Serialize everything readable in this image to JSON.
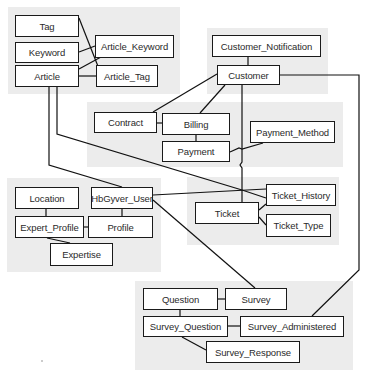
{
  "diagram": {
    "type": "entity-relationship",
    "groups": [
      {
        "id": "content",
        "entities": [
          "Tag",
          "Keyword",
          "Article",
          "Article_Keyword",
          "Article_Tag"
        ]
      },
      {
        "id": "customer",
        "entities": [
          "Customer_Notification",
          "Customer"
        ]
      },
      {
        "id": "billing",
        "entities": [
          "Contract",
          "Billing",
          "Payment",
          "Payment_Method"
        ]
      },
      {
        "id": "user",
        "entities": [
          "Location",
          "HbGyver_User",
          "Expert_Profile",
          "Profile",
          "Expertise"
        ]
      },
      {
        "id": "ticket",
        "entities": [
          "Ticket",
          "Ticket_History",
          "Ticket_Type"
        ]
      },
      {
        "id": "survey",
        "entities": [
          "Question",
          "Survey",
          "Survey_Question",
          "Survey_Administered",
          "Survey_Response"
        ]
      }
    ],
    "entities": {
      "tag": "Tag",
      "keyword": "Keyword",
      "article": "Article",
      "article_keyword": "Article_Keyword",
      "article_tag": "Article_Tag",
      "customer_notification": "Customer_Notification",
      "customer": "Customer",
      "contract": "Contract",
      "billing": "Billing",
      "payment": "Payment",
      "payment_method": "Payment_Method",
      "location": "Location",
      "hbgyver_user": "HbGyver_User",
      "expert_profile": "Expert_Profile",
      "profile": "Profile",
      "expertise": "Expertise",
      "ticket": "Ticket",
      "ticket_history": "Ticket_History",
      "ticket_type": "Ticket_Type",
      "question": "Question",
      "survey": "Survey",
      "survey_question": "Survey_Question",
      "survey_administered": "Survey_Administered",
      "survey_response": "Survey_Response"
    },
    "relationships": [
      [
        "Tag",
        "Article_Tag"
      ],
      [
        "Keyword",
        "Article_Keyword"
      ],
      [
        "Article",
        "Article_Keyword"
      ],
      [
        "Article",
        "Article_Tag"
      ],
      [
        "Article",
        "HbGyver_User"
      ],
      [
        "Article",
        "Ticket_History"
      ],
      [
        "Customer_Notification",
        "Customer"
      ],
      [
        "Customer",
        "Contract"
      ],
      [
        "Customer",
        "Billing"
      ],
      [
        "Customer",
        "Ticket"
      ],
      [
        "Customer",
        "Survey_Administered"
      ],
      [
        "Contract",
        "Billing"
      ],
      [
        "Billing",
        "Payment"
      ],
      [
        "Payment",
        "Payment_Method"
      ],
      [
        "Location",
        "Expert_Profile"
      ],
      [
        "HbGyver_User",
        "Profile"
      ],
      [
        "Expert_Profile",
        "Profile"
      ],
      [
        "Expert_Profile",
        "Expertise"
      ],
      [
        "HbGyver_User",
        "Ticket_History"
      ],
      [
        "HbGyver_User",
        "Survey"
      ],
      [
        "Ticket",
        "Ticket_History"
      ],
      [
        "Ticket",
        "Ticket_Type"
      ],
      [
        "Question",
        "Survey"
      ],
      [
        "Question",
        "Survey_Question"
      ],
      [
        "Survey_Question",
        "Survey_Administered"
      ],
      [
        "Survey_Question",
        "Survey_Response"
      ]
    ]
  }
}
